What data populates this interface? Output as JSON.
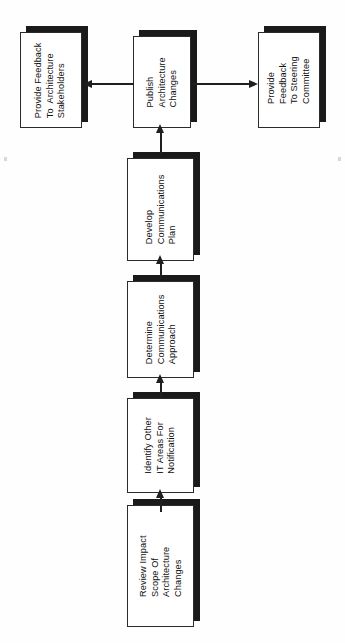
{
  "diagram": {
    "orientation": "rotated-90-ccw",
    "background_color": "#ffffff",
    "box_face_color": "#ffffff",
    "box_border_color": "#2b2b2b",
    "box_shadow_color": "#1a1a1a",
    "connector_color": "#1f1f1f",
    "nodes": [
      {
        "id": "review-impact-scope",
        "text": "Review Impact\nScope Of\nArchitecture\nChanges",
        "lines": [
          "Review Impact",
          "Scope Of",
          "Architecture",
          "Changes"
        ]
      },
      {
        "id": "identify-other-it-areas",
        "text": "Identify Other\nIT Areas For\nNotification",
        "lines": [
          "Identify Other",
          "IT Areas For",
          "Notification"
        ]
      },
      {
        "id": "determine-communications-approach",
        "text": "Determine\nCommunications\nApproach",
        "lines": [
          "Determine",
          "Communications",
          "Approach"
        ]
      },
      {
        "id": "develop-communications-plan",
        "text": "Develop\nCommunications\nPlan",
        "lines": [
          "Develop",
          "Communications",
          "Plan"
        ]
      },
      {
        "id": "publish-architecture-changes",
        "text": "Publish\nArchitecture\nChanges",
        "lines": [
          "Publish",
          "Architecture",
          "Changes"
        ]
      },
      {
        "id": "provide-feedback-architecture-stakeholders",
        "text": "Provide Feedback\nTo  Architecture\nStakeholders",
        "lines": [
          "Provide Feedback",
          "To  Architecture",
          "Stakeholders"
        ]
      },
      {
        "id": "provide-feedback-steering-committee",
        "text": "Provide\nFeedback\nTo Steering\nCommittee",
        "lines": [
          "Provide",
          "Feedback",
          "To Steering",
          "Committee"
        ]
      }
    ],
    "edges": [
      {
        "from": "review-impact-scope",
        "to": "identify-other-it-areas",
        "direction": "up"
      },
      {
        "from": "identify-other-it-areas",
        "to": "determine-communications-approach",
        "direction": "up"
      },
      {
        "from": "determine-communications-approach",
        "to": "develop-communications-plan",
        "direction": "up"
      },
      {
        "from": "develop-communications-plan",
        "to": "publish-architecture-changes",
        "direction": "up"
      },
      {
        "from": "publish-architecture-changes",
        "to": "provide-feedback-architecture-stakeholders",
        "direction": "left"
      },
      {
        "from": "publish-architecture-changes",
        "to": "provide-feedback-steering-committee",
        "direction": "right"
      }
    ]
  }
}
